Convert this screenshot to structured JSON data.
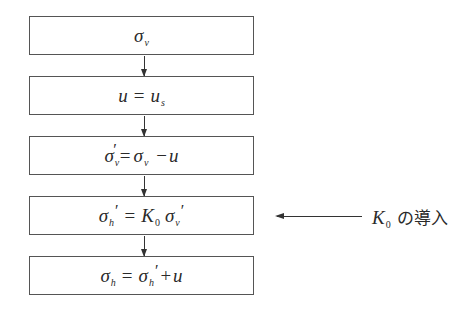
{
  "diagram": {
    "type": "flowchart",
    "direction": "top-to-bottom",
    "steps": [
      {
        "id": "step1",
        "formula": "σ_v",
        "parts": {
          "symbol": "σ",
          "sub": "v"
        }
      },
      {
        "id": "step2",
        "formula": "u = u_s",
        "parts": {
          "lhs": "u",
          "op": "=",
          "rhs": "u",
          "rhs_sub": "s"
        }
      },
      {
        "id": "step3",
        "formula": "σ'_v = σ_v − u",
        "parts": {
          "lhs": "σ",
          "lhs_sub": "v",
          "prime": "′",
          "op": "=",
          "rhs1": "σ",
          "rhs1_sub": "v",
          "op2": "−",
          "rhs2": "u"
        }
      },
      {
        "id": "step4",
        "formula": "σ'_h = K_0 σ'_v",
        "parts": {
          "lhs": "σ",
          "lhs_sub": "h",
          "prime": "′",
          "op": "=",
          "k": "K",
          "k_sub": "0",
          "rhs": "σ",
          "rhs_sub": "v",
          "rhs_prime": "′"
        }
      },
      {
        "id": "step5",
        "formula": "σ_h = σ'_h + u",
        "parts": {
          "lhs": "σ",
          "lhs_sub": "h",
          "op": "=",
          "rhs1": "σ",
          "rhs1_sub": "h",
          "rhs1_prime": "′",
          "op2": "+",
          "rhs2": "u"
        }
      }
    ],
    "annotation": {
      "target_step": "step4",
      "symbol": "K",
      "symbol_sub": "0",
      "text": "の導入",
      "full_label": "K₀ の導入"
    },
    "colors": {
      "border": "#555555",
      "arrow": "#333333",
      "text": "#2a2a2a",
      "background": "#ffffff"
    }
  }
}
